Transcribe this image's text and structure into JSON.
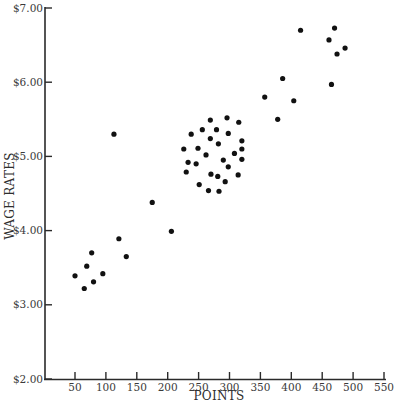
{
  "chart_data": {
    "type": "scatter",
    "title": "",
    "xlabel": "POINTS",
    "ylabel": "WAGE RATES",
    "xlim": [
      0,
      550
    ],
    "ylim": [
      2.0,
      7.0
    ],
    "grid": false,
    "legend": null,
    "x_ticks": [
      50,
      100,
      150,
      200,
      250,
      300,
      350,
      400,
      450,
      500,
      550
    ],
    "x_tick_labels": [
      "50",
      "100",
      "150",
      "200",
      "250",
      "300",
      "350",
      "400",
      "450",
      "500",
      "550"
    ],
    "y_ticks": [
      2.0,
      3.0,
      4.0,
      5.0,
      6.0,
      7.0
    ],
    "y_tick_labels": [
      "$2.00",
      "$3.00",
      "$4.00",
      "$5.00",
      "$6.00",
      "$7.00"
    ],
    "series": [
      {
        "name": "Jobs",
        "color": "#111111",
        "points": [
          {
            "x": 50,
            "y": 3.39
          },
          {
            "x": 65,
            "y": 3.22
          },
          {
            "x": 69,
            "y": 3.52
          },
          {
            "x": 77,
            "y": 3.7
          },
          {
            "x": 80,
            "y": 3.31
          },
          {
            "x": 95,
            "y": 3.42
          },
          {
            "x": 113,
            "y": 5.3
          },
          {
            "x": 121,
            "y": 3.89
          },
          {
            "x": 133,
            "y": 3.65
          },
          {
            "x": 175,
            "y": 4.38
          },
          {
            "x": 206,
            "y": 3.99
          },
          {
            "x": 226,
            "y": 5.1
          },
          {
            "x": 230,
            "y": 4.79
          },
          {
            "x": 233,
            "y": 4.92
          },
          {
            "x": 238,
            "y": 5.3
          },
          {
            "x": 246,
            "y": 4.9
          },
          {
            "x": 249,
            "y": 5.11
          },
          {
            "x": 251,
            "y": 4.62
          },
          {
            "x": 256,
            "y": 5.36
          },
          {
            "x": 262,
            "y": 5.02
          },
          {
            "x": 266,
            "y": 4.54
          },
          {
            "x": 269,
            "y": 5.49
          },
          {
            "x": 269,
            "y": 5.24
          },
          {
            "x": 270,
            "y": 4.76
          },
          {
            "x": 279,
            "y": 5.36
          },
          {
            "x": 281,
            "y": 4.73
          },
          {
            "x": 282,
            "y": 5.17
          },
          {
            "x": 283,
            "y": 4.53
          },
          {
            "x": 290,
            "y": 4.95
          },
          {
            "x": 293,
            "y": 4.66
          },
          {
            "x": 296,
            "y": 5.52
          },
          {
            "x": 298,
            "y": 5.31
          },
          {
            "x": 298,
            "y": 4.86
          },
          {
            "x": 308,
            "y": 5.04
          },
          {
            "x": 314,
            "y": 4.75
          },
          {
            "x": 315,
            "y": 5.46
          },
          {
            "x": 320,
            "y": 5.21
          },
          {
            "x": 320,
            "y": 5.1
          },
          {
            "x": 320,
            "y": 4.96
          },
          {
            "x": 357,
            "y": 5.8
          },
          {
            "x": 378,
            "y": 5.5
          },
          {
            "x": 386,
            "y": 6.05
          },
          {
            "x": 404,
            "y": 5.75
          },
          {
            "x": 415,
            "y": 6.7
          },
          {
            "x": 461,
            "y": 6.57
          },
          {
            "x": 465,
            "y": 5.97
          },
          {
            "x": 470,
            "y": 6.73
          },
          {
            "x": 474,
            "y": 6.38
          },
          {
            "x": 487,
            "y": 6.46
          }
        ]
      }
    ]
  }
}
